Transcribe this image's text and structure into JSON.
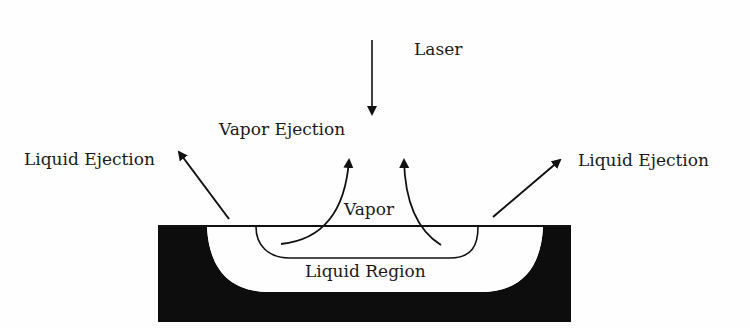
{
  "diagram": {
    "labels": {
      "laser": "Laser",
      "vapor_ejection": "Vapor Ejection",
      "liquid_ejection_left": "Liquid Ejection",
      "liquid_ejection_right": "Liquid Ejection",
      "vapor": "Vapor",
      "liquid_region": "Liquid Region"
    },
    "colors": {
      "ink": "#111111",
      "substrate": "#0d0d0d",
      "background": "#fefefe"
    }
  }
}
